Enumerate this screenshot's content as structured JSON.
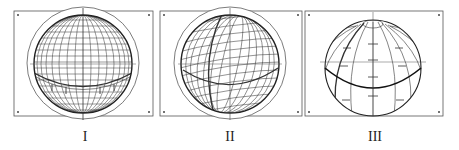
{
  "panels": [
    {
      "label": "I",
      "view": "sphere with latitude/longitude grid, viewed near equator, axis vertical"
    },
    {
      "label": "II",
      "view": "sphere with grid, rotated/tilted view"
    },
    {
      "label": "III",
      "view": "sphere with meridians and equator, pole tilted toward viewer"
    }
  ],
  "colors": {
    "stroke": "#222222",
    "frame": "#555555",
    "background": "#ffffff"
  }
}
